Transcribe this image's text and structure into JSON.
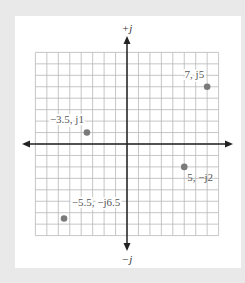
{
  "diagram": {
    "axes": {
      "positive_imag_label": "+j",
      "negative_imag_label": "−j",
      "grid_range": [
        -8,
        8
      ]
    },
    "points": [
      {
        "re": 7,
        "im": 5,
        "label": "7, j5"
      },
      {
        "re": -3.5,
        "im": 1,
        "label": "−3.5, j1"
      },
      {
        "re": 5,
        "im": -2,
        "label": "5, −j2"
      },
      {
        "re": -5.5,
        "im": -6.5,
        "label": "−5.5, −j6.5"
      }
    ],
    "colors": {
      "grid": "#b8b8b8",
      "axis": "#222222",
      "point": "#7a7a7a",
      "background": "#e9e9e9",
      "panel": "#ffffff"
    }
  }
}
